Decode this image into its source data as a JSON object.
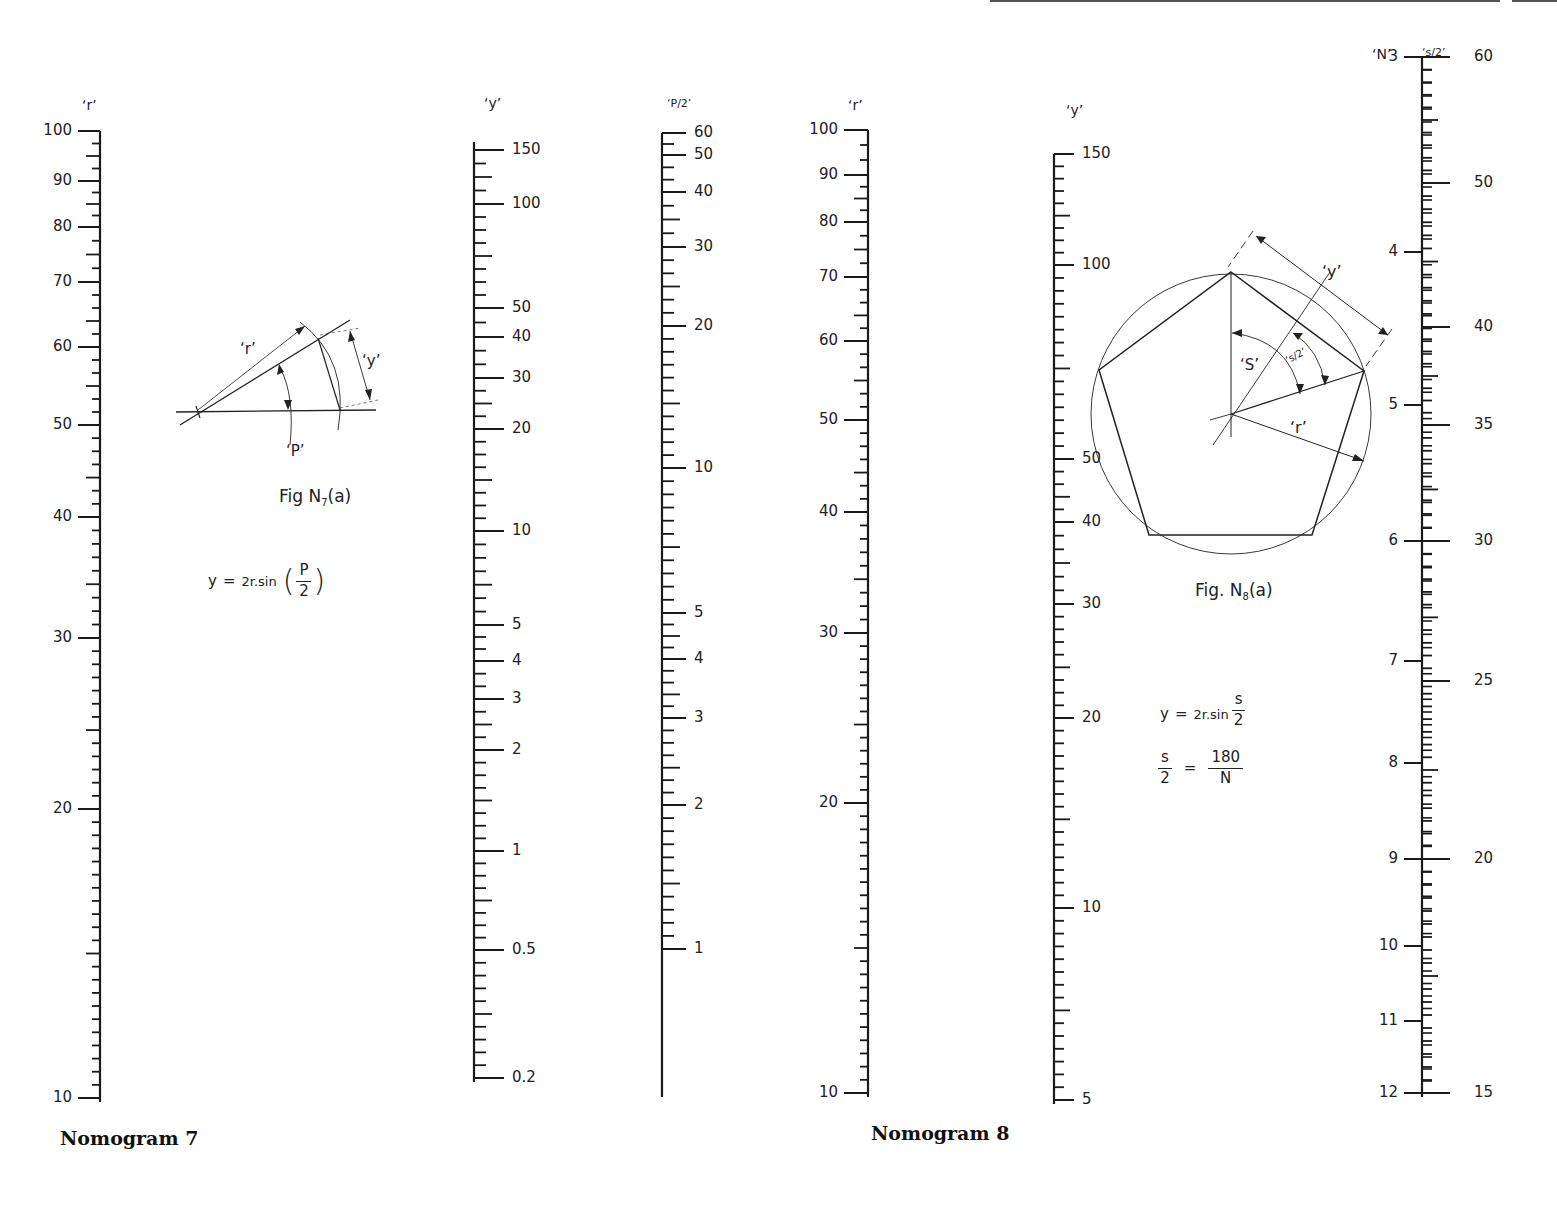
{
  "page": {
    "top_rule": {
      "x1": 990,
      "x2": 1500,
      "x3": 1512,
      "x4": 1557
    }
  },
  "nomogram7": {
    "caption": "Nomogram 7",
    "figure": {
      "caption_main": "Fig N",
      "caption_sub": "7",
      "caption_tail": "(a)",
      "label_r": "‘r’",
      "label_y": "‘y’",
      "label_p": "‘P’"
    },
    "equation": {
      "lhs": "y",
      "eq": "=",
      "rhs_prefix": "2r.sin",
      "frac_num": "P",
      "frac_den": "2",
      "open_paren": "(",
      "close_paren": ")"
    },
    "scales": {
      "r": {
        "title": "‘r’",
        "x": 100,
        "title_x": 82,
        "title_y": 97
      },
      "y": {
        "title": "‘y’",
        "x": 474,
        "title_x": 484,
        "title_y": 95
      },
      "p2": {
        "title": "‘P/2’",
        "x": 662,
        "title_x": 667,
        "title_y": 97
      }
    }
  },
  "nomogram8": {
    "caption": "Nomogram 8",
    "figure": {
      "caption_main": "Fig. N",
      "caption_sub": "8",
      "caption_tail": "(a)",
      "label_y": "‘y’",
      "label_s": "‘S’",
      "label_s2": "‘s/2’",
      "label_r": "‘r’"
    },
    "equations": {
      "line1": {
        "lhs": "y",
        "eq": "=",
        "rhs_prefix": "2r.sin",
        "frac_num": "s",
        "frac_den": "2"
      },
      "line2": {
        "lhs_num": "s",
        "lhs_den": "2",
        "eq": "=",
        "rhs_num": "180",
        "rhs_den": "N"
      }
    },
    "scales": {
      "r": {
        "title": "‘r’",
        "x": 868,
        "title_x": 848,
        "title_y": 97
      },
      "y": {
        "title": "‘y’",
        "x": 1054,
        "title_x": 1066,
        "title_y": 102
      },
      "n": {
        "title": "‘N’",
        "x": 1422,
        "title_x": 1372,
        "title_y": 46
      },
      "s2": {
        "title": "‘s/2’",
        "x": 1422,
        "title_x": 1422,
        "title_y": 46
      }
    }
  },
  "chart_data": [
    {
      "type": "nomogram",
      "title": "Nomogram 7",
      "equation": "y = 2r.sin(P/2)",
      "axes": [
        {
          "name": "r",
          "scale": "log",
          "range": [
            10,
            100
          ],
          "labeled_ticks": [
            {
              "v": 100,
              "y": 131
            },
            {
              "v": 90,
              "y": 181
            },
            {
              "v": 80,
              "y": 227
            },
            {
              "v": 70,
              "y": 282
            },
            {
              "v": 60,
              "y": 347
            },
            {
              "v": 50,
              "y": 425
            },
            {
              "v": 40,
              "y": 517
            },
            {
              "v": 30,
              "y": 638
            },
            {
              "v": 20,
              "y": 809
            },
            {
              "v": 10,
              "y": 1098
            }
          ]
        },
        {
          "name": "y",
          "scale": "log",
          "range": [
            0.2,
            150
          ],
          "labeled_ticks": [
            {
              "v": "150",
              "y": 150
            },
            {
              "v": "100",
              "y": 204
            },
            {
              "v": "50",
              "y": 308
            },
            {
              "v": "40",
              "y": 337
            },
            {
              "v": "30",
              "y": 378
            },
            {
              "v": "20",
              "y": 429
            },
            {
              "v": "10",
              "y": 531
            },
            {
              "v": "5",
              "y": 625
            },
            {
              "v": "4",
              "y": 661
            },
            {
              "v": "3",
              "y": 699
            },
            {
              "v": "2",
              "y": 750
            },
            {
              "v": "1",
              "y": 851
            },
            {
              "v": "0.5",
              "y": 950
            },
            {
              "v": "0.2",
              "y": 1078
            }
          ]
        },
        {
          "name": "P/2",
          "scale": "log-sin",
          "range": [
            0.5,
            60
          ],
          "labeled_ticks": [
            {
              "v": "60",
              "y": 133
            },
            {
              "v": "50",
              "y": 155
            },
            {
              "v": "40",
              "y": 192
            },
            {
              "v": "30",
              "y": 247
            },
            {
              "v": "20",
              "y": 326
            },
            {
              "v": "10",
              "y": 468
            },
            {
              "v": "5",
              "y": 613
            },
            {
              "v": "4",
              "y": 659
            },
            {
              "v": "3",
              "y": 718
            },
            {
              "v": "2",
              "y": 805
            },
            {
              "v": "1",
              "y": 949
            }
          ]
        }
      ]
    },
    {
      "type": "nomogram",
      "title": "Nomogram 8",
      "equation": "y = 2r.sin(s/2); s/2 = 180/N",
      "axes": [
        {
          "name": "r",
          "scale": "log",
          "range": [
            10,
            100
          ],
          "labeled_ticks": [
            {
              "v": 100,
              "y": 130
            },
            {
              "v": 90,
              "y": 175
            },
            {
              "v": 80,
              "y": 222
            },
            {
              "v": 70,
              "y": 277
            },
            {
              "v": 60,
              "y": 341
            },
            {
              "v": 50,
              "y": 420
            },
            {
              "v": 40,
              "y": 512
            },
            {
              "v": 30,
              "y": 633
            },
            {
              "v": 20,
              "y": 803
            },
            {
              "v": 10,
              "y": 1093
            }
          ]
        },
        {
          "name": "y",
          "scale": "log",
          "range": [
            5,
            150
          ],
          "labeled_ticks": [
            {
              "v": "150",
              "y": 154
            },
            {
              "v": "100",
              "y": 265
            },
            {
              "v": "50",
              "y": 459
            },
            {
              "v": "40",
              "y": 522
            },
            {
              "v": "30",
              "y": 604
            },
            {
              "v": "20",
              "y": 718
            },
            {
              "v": "10",
              "y": 908
            },
            {
              "v": "5",
              "y": 1100
            }
          ]
        },
        {
          "name": "N",
          "scale": "log-sin",
          "range": [
            3,
            12
          ],
          "labeled_ticks": [
            {
              "v": "3",
              "y": 57
            },
            {
              "v": "4",
              "y": 252
            },
            {
              "v": "5",
              "y": 405
            },
            {
              "v": "6",
              "y": 541
            },
            {
              "v": "7",
              "y": 661
            },
            {
              "v": "8",
              "y": 763
            },
            {
              "v": "9",
              "y": 859
            },
            {
              "v": "10",
              "y": 946
            },
            {
              "v": "11",
              "y": 1021
            },
            {
              "v": "12",
              "y": 1093
            }
          ]
        },
        {
          "name": "s/2",
          "scale": "log-sin",
          "range": [
            15,
            60
          ],
          "labeled_ticks": [
            {
              "v": "60",
              "y": 57
            },
            {
              "v": "50",
              "y": 183
            },
            {
              "v": "40",
              "y": 327
            },
            {
              "v": "35",
              "y": 425
            },
            {
              "v": "30",
              "y": 541
            },
            {
              "v": "25",
              "y": 681
            },
            {
              "v": "20",
              "y": 859
            },
            {
              "v": "15",
              "y": 1093
            }
          ]
        }
      ]
    }
  ]
}
